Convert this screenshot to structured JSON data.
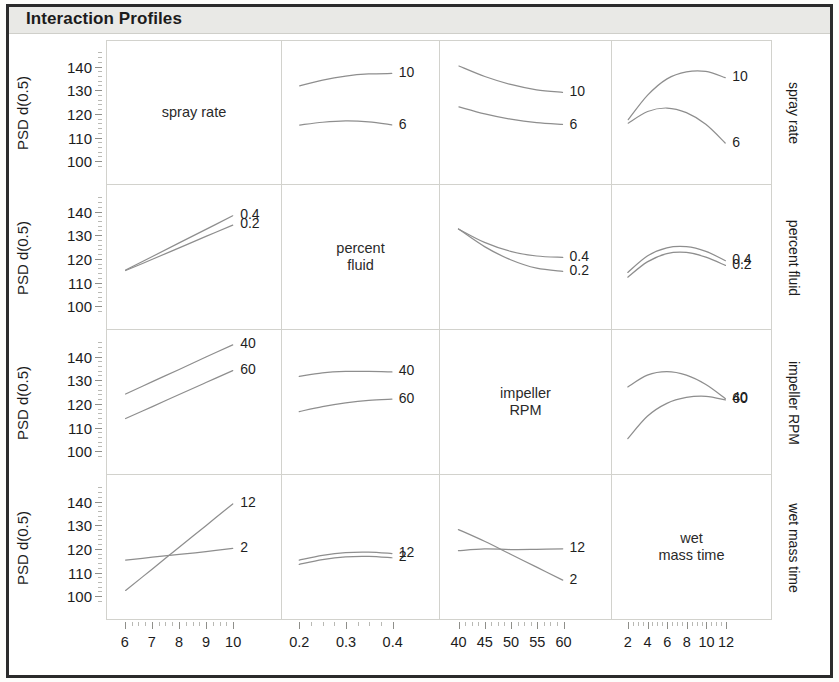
{
  "header": {
    "title": "Interaction Profiles"
  },
  "axes": {
    "y_title": "PSD d(0.5)",
    "y_ticks": [
      "140",
      "130",
      "120",
      "110",
      "100"
    ],
    "y_min": 95,
    "y_max": 147
  },
  "factors": [
    {
      "name": "spray rate",
      "display": "spray rate",
      "x_ticks": [
        "6",
        "7",
        "8",
        "9",
        "10"
      ],
      "x_min": 5.6,
      "x_max": 10.4,
      "levels": [
        "10",
        "6"
      ]
    },
    {
      "name": "percent fluid",
      "display": "percent\nfluid",
      "x_ticks": [
        "0.2",
        "0.3",
        "0.4"
      ],
      "x_min": 0.18,
      "x_max": 0.42,
      "levels": [
        "0.4",
        "0.2"
      ]
    },
    {
      "name": "impeller RPM",
      "display": "impeller\nRPM",
      "x_ticks": [
        "40",
        "45",
        "50",
        "55",
        "60"
      ],
      "x_min": 38,
      "x_max": 62,
      "levels": [
        "40",
        "60"
      ]
    },
    {
      "name": "wet mass time",
      "display": "wet\nmass time",
      "x_ticks": [
        "2",
        "4",
        "6",
        "8",
        "10",
        "12"
      ],
      "x_min": 1.2,
      "x_max": 12.8,
      "levels": [
        "12",
        "2"
      ]
    }
  ],
  "chart_data": {
    "type": "line",
    "title": "Interaction Profiles",
    "ylabel": "PSD d(0.5)",
    "ylim": [
      95,
      147
    ],
    "grid": false,
    "legend_position": "inline-right-end-labels",
    "row_factors": [
      "spray rate",
      "percent fluid",
      "impeller RPM",
      "wet mass time"
    ],
    "column_factors": [
      "spray rate",
      "percent fluid",
      "impeller RPM",
      "wet mass time"
    ],
    "cells": [
      {
        "row": 0,
        "col": 0,
        "diagonal": true,
        "label": "spray rate"
      },
      {
        "row": 0,
        "col": 1,
        "diagonal": false,
        "x": [
          0.2,
          0.25,
          0.3,
          0.35,
          0.4
        ],
        "series": [
          {
            "name": "10",
            "values": [
              132,
              134.5,
              136.2,
              137.1,
              137.3
            ]
          },
          {
            "name": "6",
            "values": [
              115.2,
              116.4,
              117.0,
              116.6,
              115.3
            ]
          }
        ]
      },
      {
        "row": 0,
        "col": 2,
        "diagonal": false,
        "x": [
          40,
          45,
          50,
          55,
          60
        ],
        "series": [
          {
            "name": "10",
            "values": [
              140.5,
              136.0,
              132.6,
              130.3,
              129.2
            ]
          },
          {
            "name": "6",
            "values": [
              123.0,
              120.0,
              117.7,
              116.2,
              115.5
            ]
          }
        ]
      },
      {
        "row": 0,
        "col": 3,
        "diagonal": false,
        "x": [
          2,
          4,
          6,
          8,
          10,
          12
        ],
        "series": [
          {
            "name": "10",
            "values": [
              117.5,
              128.0,
              135.0,
              138.0,
              138.2,
              135.5
            ]
          },
          {
            "name": "6",
            "values": [
              116.0,
              121.0,
              122.5,
              120.5,
              115.5,
              107.5
            ]
          }
        ]
      },
      {
        "row": 1,
        "col": 0,
        "diagonal": false,
        "x": [
          6,
          7,
          8,
          9,
          10
        ],
        "series": [
          {
            "name": "0.4",
            "values": [
              115.0,
              120.8,
              126.6,
              132.4,
              138.2
            ]
          },
          {
            "name": "0.2",
            "values": [
              114.8,
              119.6,
              124.5,
              129.4,
              134.2
            ]
          }
        ]
      },
      {
        "row": 1,
        "col": 1,
        "diagonal": true,
        "label": "percent fluid"
      },
      {
        "row": 1,
        "col": 2,
        "diagonal": false,
        "x": [
          40,
          45,
          50,
          55,
          60
        ],
        "series": [
          {
            "name": "0.4",
            "values": [
              132.5,
              126.8,
              123.0,
              121.0,
              120.4
            ]
          },
          {
            "name": "0.2",
            "values": [
              132.5,
              125.0,
              119.4,
              115.8,
              114.5
            ]
          }
        ]
      },
      {
        "row": 1,
        "col": 3,
        "diagonal": false,
        "x": [
          2,
          4,
          6,
          8,
          10,
          12
        ],
        "series": [
          {
            "name": "0.4",
            "values": [
              114.0,
              121.0,
              124.5,
              125.0,
              123.0,
              119.0
            ]
          },
          {
            "name": "0.2",
            "values": [
              112.0,
              118.5,
              122.0,
              122.5,
              120.5,
              117.0
            ]
          }
        ]
      },
      {
        "row": 2,
        "col": 0,
        "diagonal": false,
        "x": [
          6,
          7,
          8,
          9,
          10
        ],
        "series": [
          {
            "name": "40",
            "values": [
              124.0,
              129.3,
              134.5,
              139.8,
              145.0
            ]
          },
          {
            "name": "60",
            "values": [
              113.5,
              118.6,
              123.8,
              128.9,
              134.0
            ]
          }
        ]
      },
      {
        "row": 2,
        "col": 1,
        "diagonal": false,
        "x": [
          0.2,
          0.25,
          0.3,
          0.35,
          0.4
        ],
        "series": [
          {
            "name": "40",
            "values": [
              131.5,
              133.0,
              133.6,
              133.6,
              133.4
            ]
          },
          {
            "name": "60",
            "values": [
              116.5,
              118.6,
              120.2,
              121.3,
              121.8
            ]
          }
        ]
      },
      {
        "row": 2,
        "col": 2,
        "diagonal": true,
        "label": "impeller RPM"
      },
      {
        "row": 2,
        "col": 3,
        "diagonal": false,
        "x": [
          2,
          4,
          6,
          8,
          10,
          12
        ],
        "series": [
          {
            "name": "40",
            "values": [
              127.0,
              132.0,
              133.5,
              132.0,
              128.0,
              122.0
            ]
          },
          {
            "name": "60",
            "values": [
              105.0,
              114.5,
              120.0,
              122.5,
              123.0,
              121.5
            ]
          }
        ]
      },
      {
        "row": 3,
        "col": 0,
        "diagonal": false,
        "x": [
          6,
          7,
          8,
          9,
          10
        ],
        "series": [
          {
            "name": "12",
            "values": [
              102.0,
              111.2,
              120.5,
              129.7,
              139.0
            ]
          },
          {
            "name": "2",
            "values": [
              115.0,
              116.2,
              117.4,
              118.6,
              120.0
            ]
          }
        ]
      },
      {
        "row": 3,
        "col": 1,
        "diagonal": false,
        "x": [
          0.2,
          0.25,
          0.3,
          0.35,
          0.4
        ],
        "series": [
          {
            "name": "12",
            "values": [
              115.0,
              117.0,
              118.2,
              118.4,
              117.8
            ]
          },
          {
            "name": "2",
            "values": [
              113.2,
              115.2,
              116.4,
              116.6,
              116.0
            ]
          }
        ]
      },
      {
        "row": 3,
        "col": 2,
        "diagonal": false,
        "x": [
          40,
          45,
          50,
          55,
          60
        ],
        "series": [
          {
            "name": "12",
            "values": [
              119.0,
              119.8,
              119.5,
              119.6,
              119.8
            ]
          },
          {
            "name": "2",
            "values": [
              128.0,
              123.0,
              117.5,
              112.0,
              106.5
            ]
          }
        ]
      },
      {
        "row": 3,
        "col": 3,
        "diagonal": true,
        "label": "wet mass time"
      }
    ]
  },
  "style": {
    "curve_color": "#8e8e8e",
    "panel_border": "#d2d2cd",
    "frame_color": "#2b2b2b",
    "title_band": "#e9e9e6",
    "text_color": "#1c1c1c"
  }
}
